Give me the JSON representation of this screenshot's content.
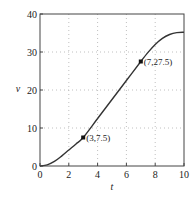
{
  "chart_data": {
    "type": "line",
    "title": "",
    "xlabel": "t",
    "ylabel": "v",
    "xlim": [
      0,
      10
    ],
    "ylim": [
      0,
      40
    ],
    "xticks": [
      0,
      2,
      4,
      6,
      8,
      10
    ],
    "yticks": [
      0,
      10,
      20,
      30,
      40
    ],
    "xtick_labels": [
      "0",
      "2",
      "4",
      "6",
      "8",
      "10"
    ],
    "ytick_labels": [
      "0",
      "10",
      "20",
      "30",
      "40"
    ],
    "grid": true,
    "grid_style": "dotted",
    "legend": null,
    "series": [
      {
        "name": "v(t)",
        "x": [
          0,
          0.5,
          1,
          1.5,
          2,
          2.5,
          3,
          4,
          5,
          6,
          7,
          7.5,
          8,
          8.5,
          9,
          9.5,
          10
        ],
        "y": [
          0,
          0.3,
          1.2,
          2.6,
          4.2,
          5.8,
          7.5,
          12.5,
          17.5,
          22.5,
          27.5,
          29.9,
          32.0,
          33.6,
          34.6,
          35.1,
          35.2
        ],
        "color": "#333333"
      }
    ],
    "points": [
      {
        "x": 3,
        "y": 7.5,
        "label": "(3,7.5)"
      },
      {
        "x": 7,
        "y": 27.5,
        "label": "(7,27.5)"
      }
    ]
  }
}
